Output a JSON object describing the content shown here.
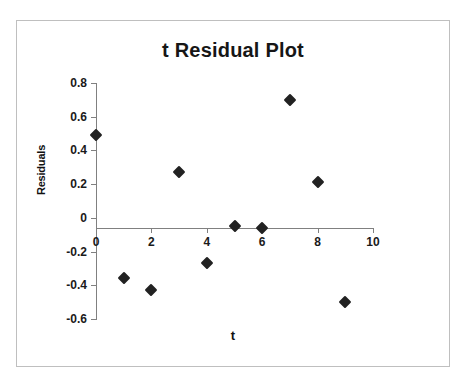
{
  "page": {
    "top_cutoff_text": "",
    "background_color": "#ffffff"
  },
  "chart": {
    "title": "t  Residual Plot",
    "xlabel": "t",
    "ylabel": "Residuals",
    "frame_color": "#bfbfbf",
    "axis_color": "#808080",
    "marker_color": "#222222"
  },
  "chart_data": {
    "type": "scatter",
    "title": "t  Residual Plot",
    "subtitle": "",
    "xlabel": "t",
    "ylabel": "Residuals",
    "xlim": [
      0,
      10
    ],
    "ylim": [
      -0.6,
      0.8
    ],
    "xticks": [
      0,
      2,
      4,
      6,
      8,
      10
    ],
    "xtick_labels": [
      "0",
      "2",
      "4",
      "6",
      "8",
      "10"
    ],
    "yticks": [
      0.8,
      0.6,
      0.4,
      0.2,
      0,
      -0.2,
      -0.4,
      -0.6
    ],
    "ytick_labels": [
      "0.8",
      "0.6",
      "0.4",
      "0.2",
      "0",
      "-0.2",
      "-0.4",
      "-0.6"
    ],
    "grid": false,
    "legend": false,
    "legend_position": "none",
    "marker": "diamond",
    "series": [
      {
        "name": "Residuals",
        "x": [
          0,
          1,
          2,
          3,
          4,
          5,
          6,
          7,
          8,
          9
        ],
        "y": [
          0.49,
          -0.355,
          -0.425,
          0.27,
          -0.27,
          -0.05,
          -0.06,
          0.7,
          0.215,
          -0.5
        ]
      }
    ],
    "points": [
      {
        "x": 0,
        "y": 0.49
      },
      {
        "x": 1,
        "y": -0.355
      },
      {
        "x": 2,
        "y": -0.425
      },
      {
        "x": 3,
        "y": 0.27
      },
      {
        "x": 4,
        "y": -0.27
      },
      {
        "x": 5,
        "y": -0.05
      },
      {
        "x": 6,
        "y": -0.06
      },
      {
        "x": 7,
        "y": 0.7
      },
      {
        "x": 8,
        "y": 0.215
      },
      {
        "x": 9,
        "y": -0.5
      }
    ]
  }
}
